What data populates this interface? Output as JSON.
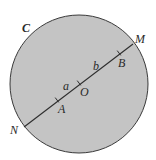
{
  "diagram": {
    "type": "circle-with-diameter",
    "colors": {
      "circle_fill": "#c4c4c4",
      "circle_stroke": "#3a3a3a",
      "line_stroke": "#2e2e2e",
      "label_color": "#2a2a2a"
    },
    "circle": {
      "label": "C",
      "cx": 79,
      "cy": 84,
      "r": 69
    },
    "diameter": {
      "endpoint_start": {
        "label": "N",
        "x": 24,
        "y": 127
      },
      "endpoint_end": {
        "label": "M",
        "x": 133,
        "y": 44
      }
    },
    "points": [
      {
        "label": "A",
        "x": 57,
        "y": 100
      },
      {
        "label": "O",
        "x": 79,
        "y": 83
      },
      {
        "label": "B",
        "x": 119,
        "y": 53
      }
    ],
    "segment_labels": [
      {
        "label": "a",
        "between": [
          "A",
          "O"
        ]
      },
      {
        "label": "b",
        "between": [
          "O",
          "B"
        ]
      }
    ]
  }
}
